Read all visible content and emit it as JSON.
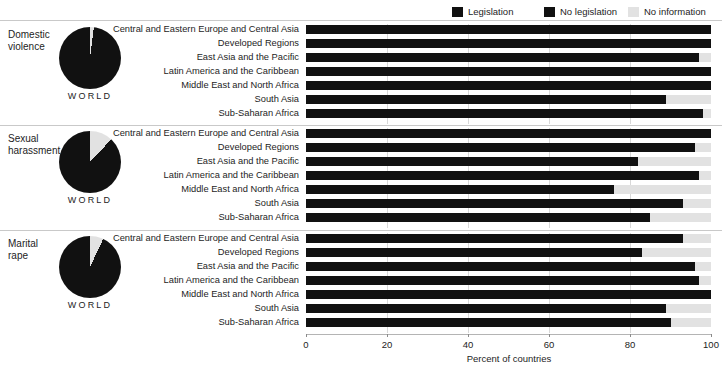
{
  "legend": {
    "items": [
      {
        "label": "Legislation",
        "color": "#111111",
        "name": "legend-legislation"
      },
      {
        "label": "No legislation",
        "color": "#111111",
        "name": "legend-no-legislation"
      },
      {
        "label": "No information",
        "color": "#e2e2e2",
        "name": "legend-no-information"
      }
    ]
  },
  "axis": {
    "title": "Percent of countries",
    "ticks": [
      "0",
      "20",
      "40",
      "60",
      "80",
      "100"
    ],
    "min": 0,
    "max": 100
  },
  "world_label": "WORLD",
  "chart_data": {
    "type": "bar",
    "xlabel": "Percent of countries",
    "ylabel": "",
    "xlim": [
      0,
      100
    ],
    "grid": true,
    "orientation": "horizontal",
    "stacked": true,
    "legend_position": "top-right",
    "categories": [
      "Central and Eastern Europe and Central Asia",
      "Developed Regions",
      "East Asia and the Pacific",
      "Latin America and the Caribbean",
      "Middle East and North Africa",
      "South Asia",
      "Sub-Saharan Africa"
    ],
    "panels": [
      {
        "name": "Domestic violence",
        "title_line1": "Domestic",
        "title_line2": "violence",
        "world_pie": {
          "legislation": 98,
          "no_information": 2
        },
        "series": [
          {
            "name": "Legislation",
            "values": [
              100,
              100,
              97,
              100,
              100,
              89,
              98
            ]
          },
          {
            "name": "No information",
            "values": [
              0,
              0,
              3,
              0,
              0,
              11,
              2
            ]
          }
        ]
      },
      {
        "name": "Sexual harassment",
        "title_line1": "Sexual",
        "title_line2": "harassment",
        "world_pie": {
          "legislation": 88,
          "no_information": 12
        },
        "series": [
          {
            "name": "Legislation",
            "values": [
              100,
              96,
              82,
              97,
              76,
              93,
              85
            ]
          },
          {
            "name": "No information",
            "values": [
              0,
              4,
              18,
              3,
              24,
              7,
              15
            ]
          }
        ]
      },
      {
        "name": "Marital rape",
        "title_line1": "Marital",
        "title_line2": "rape",
        "world_pie": {
          "legislation": 93,
          "no_information": 7
        },
        "series": [
          {
            "name": "Legislation",
            "values": [
              93,
              83,
              96,
              97,
              100,
              89,
              90
            ]
          },
          {
            "name": "No information",
            "values": [
              7,
              17,
              4,
              3,
              0,
              11,
              10
            ]
          }
        ]
      }
    ]
  }
}
